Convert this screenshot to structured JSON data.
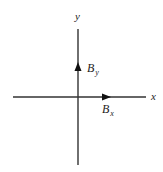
{
  "diagram": {
    "title": "",
    "axes": {
      "x_label": "x",
      "y_label": "y",
      "color": "#333333"
    },
    "vectors": [
      {
        "name": "B",
        "subscript": "x",
        "direction": "positive-x"
      },
      {
        "name": "B",
        "subscript": "y",
        "direction": "positive-y"
      }
    ]
  }
}
